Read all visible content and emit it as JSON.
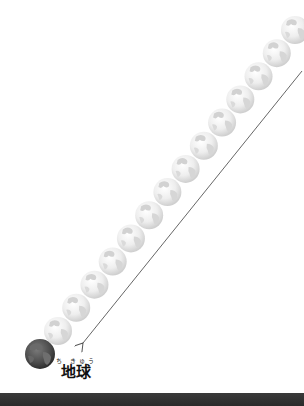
{
  "diagram": {
    "label": {
      "kanji": "地球",
      "ruby": "ち きゅう"
    },
    "earth": {
      "cx": 40,
      "cy": 354,
      "r": 15,
      "color": "#4a4a4a"
    },
    "ghost_globes": {
      "count": 14,
      "start": {
        "cx": 58,
        "cy": 331
      },
      "end": {
        "cx": 295,
        "cy": 30
      },
      "r": 14,
      "color": "#e6e6e6"
    },
    "arrow": {
      "x1": 302,
      "y1": 71,
      "x2": 83,
      "y2": 343,
      "color": "#555555"
    }
  },
  "footer": {
    "bar_color": "#2e2e2e"
  }
}
